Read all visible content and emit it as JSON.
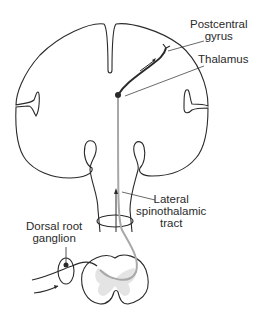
{
  "diagram": {
    "labels": {
      "postcentral_gyrus": [
        "Postcentral",
        "gyrus"
      ],
      "thalamus": "Thalamus",
      "lateral_spinothalamic_tract": [
        "Lateral",
        "spinothalamic",
        "tract"
      ],
      "dorsal_root_ganglion": [
        "Dorsal root",
        "ganglion"
      ]
    },
    "colors": {
      "outline": "#2a2a2a",
      "tract": "#a8a8a8",
      "gray_matter": "#d8d8d8",
      "background": "#ffffff"
    }
  }
}
